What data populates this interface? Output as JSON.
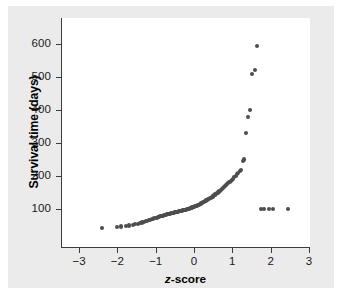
{
  "chart_data": {
    "type": "scatter",
    "title": "",
    "subtitle": "",
    "xlabel": "z-score",
    "xlabel_italic_prefix": "z",
    "xlabel_rest": "-score",
    "ylabel": "Survival time (days)",
    "xlim": [
      -3.5,
      3.5
    ],
    "ylim": [
      20,
      640
    ],
    "grid": false,
    "legend": null,
    "xticks": [
      -3,
      -2,
      -1,
      0,
      1,
      2,
      3
    ],
    "xticklabels": [
      "−3",
      "−2",
      "−1",
      "0",
      "1",
      "2",
      "3"
    ],
    "yticks": [
      100,
      200,
      300,
      400,
      500,
      600
    ],
    "yticklabels": [
      "100",
      "200",
      "300",
      "400",
      "500",
      "600"
    ],
    "marker": "circle",
    "marker_color": "#4d4d4d",
    "marker_size_px": 4.1,
    "series": [
      {
        "name": "Survival time normal quantile plot",
        "x": [
          -2.44,
          -2.03,
          -1.93,
          -1.79,
          -1.72,
          -1.63,
          -1.56,
          -1.5,
          -1.44,
          -1.39,
          -1.34,
          -1.29,
          -1.25,
          -1.21,
          -1.17,
          -1.13,
          -1.09,
          -1.06,
          -1.02,
          -0.99,
          -0.96,
          -0.93,
          -0.9,
          -0.87,
          -0.84,
          -0.81,
          -0.78,
          -0.76,
          -0.73,
          -0.7,
          -0.68,
          -0.65,
          -0.63,
          -0.6,
          -0.58,
          -0.55,
          -0.53,
          -0.51,
          -0.48,
          -0.46,
          -0.44,
          -0.41,
          -0.39,
          -0.37,
          -0.35,
          -0.32,
          -0.3,
          -0.28,
          -0.26,
          -0.24,
          -0.21,
          -0.19,
          -0.17,
          -0.15,
          -0.13,
          -0.11,
          -0.09,
          -0.07,
          -0.04,
          -0.02,
          0.0,
          0.02,
          0.04,
          0.07,
          0.09,
          0.11,
          0.13,
          0.15,
          0.17,
          0.19,
          0.21,
          0.24,
          0.26,
          0.28,
          0.3,
          0.32,
          0.35,
          0.37,
          0.39,
          0.41,
          0.44,
          0.46,
          0.48,
          0.51,
          0.53,
          0.55,
          0.58,
          0.6,
          0.63,
          0.65,
          0.68,
          0.7,
          0.73,
          0.76,
          0.78,
          0.81,
          0.84,
          0.87,
          0.9,
          0.93,
          0.96,
          0.99,
          1.02,
          1.06,
          1.09,
          1.13,
          1.17,
          1.21,
          1.25,
          1.29,
          1.34,
          1.39,
          1.44,
          1.5,
          1.56,
          1.63,
          1.72,
          1.79,
          1.93,
          2.03,
          2.44
        ],
        "y": [
          43,
          45,
          47,
          49,
          50,
          52,
          54,
          55,
          57,
          59,
          61,
          63,
          65,
          66,
          68,
          69,
          70,
          72,
          73,
          74,
          76,
          77,
          78,
          79,
          80,
          81,
          82,
          83,
          84,
          85,
          86,
          86,
          87,
          88,
          88,
          89,
          90,
          90,
          91,
          92,
          92,
          93,
          94,
          94,
          95,
          96,
          96,
          97,
          98,
          98,
          99,
          100,
          100,
          101,
          102,
          103,
          104,
          105,
          106,
          107,
          108,
          109,
          110,
          111,
          112,
          113,
          114,
          116,
          117,
          118,
          120,
          121,
          123,
          124,
          126,
          127,
          129,
          131,
          132,
          134,
          136,
          138,
          140,
          142,
          144,
          146,
          148,
          150,
          153,
          155,
          158,
          160,
          163,
          166,
          169,
          172,
          175,
          178,
          181,
          185,
          188,
          192,
          196,
          200,
          205,
          210,
          214,
          218,
          246,
          250,
          330,
          380,
          400,
          510,
          520,
          595,
          100,
          100,
          100,
          100,
          100
        ]
      }
    ]
  },
  "plot_geometry": {
    "x_pixel_at_zero": 194,
    "x_pixels_per_unit": 38.3,
    "y_pixel_at_100": 209,
    "y_pixels_per_100": 33.0
  },
  "colors": {
    "figure_background": "#ebebeb",
    "plot_background": "#ffffff",
    "axis": "#3c3c3c",
    "marker": "#4d4d4d",
    "text": "#1a1a1a"
  }
}
